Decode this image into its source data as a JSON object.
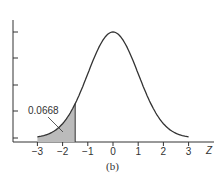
{
  "chart_data": {
    "type": "area",
    "title": "",
    "xlabel": "Z",
    "ylabel": "",
    "caption": "(b)",
    "x_ticks": [
      -3,
      -2,
      -1,
      0,
      1,
      2,
      3
    ],
    "x_tick_labels": [
      "−3",
      "−2",
      "−1",
      "0",
      "1",
      "2",
      "3"
    ],
    "xlim": [
      -3,
      3
    ],
    "y_ticks_count": 5,
    "curve": "standard normal density",
    "shaded_region": {
      "from": -3,
      "to": -1.5
    },
    "annotation": {
      "text": "0.0668",
      "points_to": "shaded left tail area"
    },
    "grid": false
  }
}
